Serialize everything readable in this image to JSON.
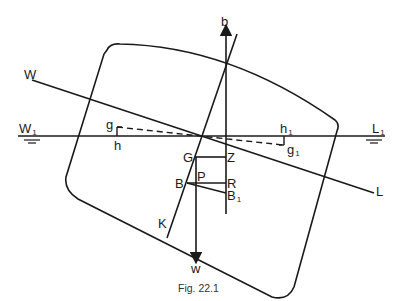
{
  "figure": {
    "caption": "Fig. 22.1",
    "labels": {
      "b": "b",
      "w": "w",
      "W": "W",
      "L": "L",
      "W1": "W",
      "W1_sub": "1",
      "L1": "L",
      "L1_sub": "1",
      "g": "g",
      "h": "h",
      "h1": "h",
      "h1_sub": "1",
      "g1": "g",
      "g1_sub": "1",
      "G": "G",
      "Z": "Z",
      "B": "B",
      "P": "P",
      "R": "R",
      "B1": "B",
      "B1_sub": "1",
      "K": "K"
    },
    "stroke_color": "#1a1a1a"
  }
}
